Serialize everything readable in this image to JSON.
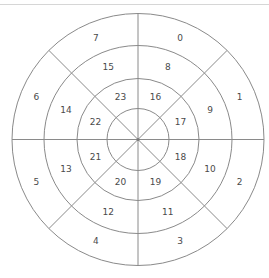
{
  "diagram": {
    "type": "polar-sector-grid",
    "center": {
      "x": 138,
      "y": 139.5
    },
    "ring_radii": [
      126,
      94,
      61,
      31
    ],
    "sector_count": 8,
    "colors": {
      "line": "#8a8a8a",
      "label": "#4a4a4a",
      "top_rule": "#d6d6d6"
    },
    "rings": [
      {
        "name": "outer",
        "label_radius": 110,
        "labels": [
          "0",
          "1",
          "2",
          "3",
          "4",
          "5",
          "6",
          "7"
        ]
      },
      {
        "name": "middle",
        "label_radius": 78,
        "labels": [
          "8",
          "9",
          "10",
          "11",
          "12",
          "13",
          "14",
          "15"
        ]
      },
      {
        "name": "inner",
        "label_radius": 46,
        "labels": [
          "16",
          "17",
          "18",
          "19",
          "20",
          "21",
          "22",
          "23"
        ]
      }
    ],
    "label_order_note": "clockwise from north, starting at the NNE sector"
  }
}
